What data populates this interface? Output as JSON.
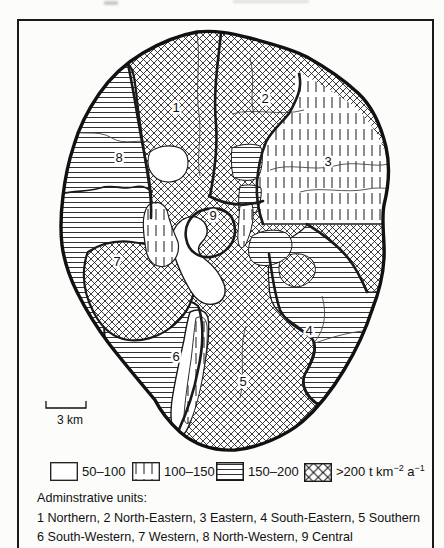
{
  "figure": {
    "map": {
      "labels": [
        {
          "n": "1"
        },
        {
          "n": "2"
        },
        {
          "n": "3"
        },
        {
          "n": "4"
        },
        {
          "n": "5"
        },
        {
          "n": "6"
        },
        {
          "n": "7"
        },
        {
          "n": "8"
        },
        {
          "n": "9"
        }
      ],
      "scale_label": "3 km"
    },
    "legend": {
      "items": [
        {
          "pattern": "blank",
          "label": "50–100"
        },
        {
          "pattern": "vertical-hatch",
          "label": "100–150"
        },
        {
          "pattern": "horizontal-hatch",
          "label": "150–200"
        }
      ],
      "gt200": {
        "base1": ">200 t km",
        "sup1": "−2",
        "base2": " a",
        "sup2": "−1"
      }
    },
    "admin": {
      "title": "Adminstrative units:",
      "line1": "1 Northern, 2 North-Eastern, 3 Eastern, 4 South-Eastern, 5 Southern",
      "line2": "6 South-Western, 7 Western, 8 North-Western, 9 Central"
    }
  }
}
